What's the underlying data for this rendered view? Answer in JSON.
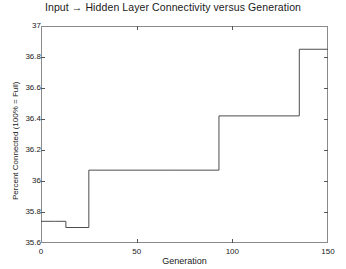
{
  "chart_data": {
    "type": "line",
    "title": "Input → Hidden Layer Connectivity versus Generation",
    "xlabel": "Generation",
    "ylabel": "Percent Connected (100% = Full)",
    "xlim": [
      0,
      150
    ],
    "ylim": [
      35.6,
      37.0
    ],
    "xticks": [
      0,
      50,
      100,
      150
    ],
    "xtick_labels": [
      "0",
      "50",
      "100",
      "150"
    ],
    "yticks": [
      35.6,
      35.8,
      36.0,
      36.2,
      36.4,
      36.6,
      36.8,
      37.0
    ],
    "ytick_labels": [
      "35.6",
      "35.8",
      "36",
      "36.2",
      "36.4",
      "36.6",
      "36.8",
      "37"
    ],
    "grid": false,
    "legend": null,
    "line_color": "#4d4d4d",
    "drawstyle": "steps-post",
    "series": [
      {
        "name": "Input to hidden layer connectivity",
        "x": [
          0,
          7,
          13,
          25,
          70,
          93,
          135,
          150
        ],
        "values": [
          35.74,
          35.74,
          35.7,
          36.07,
          36.07,
          36.42,
          36.85,
          36.85
        ]
      }
    ],
    "annotations": []
  },
  "axes": {
    "title": "Input → Hidden Layer Connectivity versus Generation",
    "x_title": "Generation",
    "y_title": "Percent Connected (100% = Full)"
  }
}
